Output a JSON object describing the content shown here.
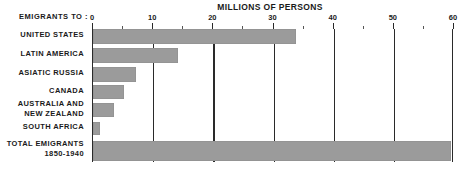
{
  "chart_data": {
    "type": "bar",
    "orientation": "horizontal",
    "title": "MILLIONS OF PERSONS",
    "xlabel": "MILLIONS OF PERSONS",
    "ylabel": "EMIGRANTS  TO :",
    "xlim": [
      0,
      60
    ],
    "grid": true,
    "legend": "none",
    "xticks": [
      0,
      10,
      20,
      30,
      40,
      50,
      60
    ],
    "xtick_labels": [
      "0",
      "10",
      "20",
      "30",
      "40",
      "50",
      "60"
    ],
    "xticks_minor": [
      5,
      15,
      25,
      35,
      45,
      55
    ],
    "categories": [
      "UNITED STATES",
      "LATIN AMERICA",
      "ASIATIC RUSSIA",
      "CANADA",
      "AUSTRALIA AND NEW ZEALAND",
      "SOUTH AFRICA",
      "TOTAL EMIGRANTS 1850-1940"
    ],
    "values": [
      33.7,
      14.1,
      7.1,
      5.1,
      3.5,
      1.2,
      59.5
    ],
    "bar_color": "#9b9b9b",
    "axis_color": "#2a2a2a",
    "background": "#ffffff"
  },
  "axis": {
    "caption": "EMIGRANTS  TO :",
    "ticks": [
      {
        "value": 0,
        "label": "0"
      },
      {
        "value": 10,
        "label": "10"
      },
      {
        "value": 20,
        "label": "20"
      },
      {
        "value": 30,
        "label": "30"
      },
      {
        "value": 40,
        "label": "40"
      },
      {
        "value": 50,
        "label": "50"
      },
      {
        "value": 60,
        "label": "60"
      }
    ]
  },
  "rows": [
    {
      "label_line1": "UNITED STATES",
      "label_line2": "",
      "value": 33.7
    },
    {
      "label_line1": "LATIN AMERICA",
      "label_line2": "",
      "value": 14.1
    },
    {
      "label_line1": "ASIATIC RUSSIA",
      "label_line2": "",
      "value": 7.1
    },
    {
      "label_line1": "CANADA",
      "label_line2": "",
      "value": 5.1
    },
    {
      "label_line1": "AUSTRALIA AND",
      "label_line2": "NEW ZEALAND",
      "value": 3.5
    },
    {
      "label_line1": "SOUTH AFRICA",
      "label_line2": "",
      "value": 1.2
    },
    {
      "label_line1": "TOTAL EMIGRANTS",
      "label_line2": "1850-1940",
      "value": 59.5
    }
  ]
}
